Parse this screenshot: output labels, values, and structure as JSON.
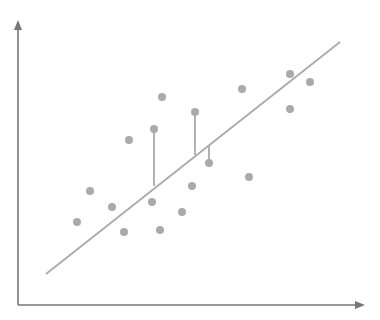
{
  "chart_data": {
    "type": "scatter",
    "title": "",
    "xlabel": "",
    "ylabel": "",
    "grid": false,
    "legend": null,
    "annotations": [
      "linear regression line",
      "residual lines for 3 points"
    ],
    "xlim": [
      0,
      100
    ],
    "ylim": [
      0,
      100
    ],
    "points": [
      {
        "x": 17,
        "y": 29
      },
      {
        "x": 21,
        "y": 40
      },
      {
        "x": 27,
        "y": 34
      },
      {
        "x": 30,
        "y": 26
      },
      {
        "x": 32,
        "y": 58
      },
      {
        "x": 39,
        "y": 36
      },
      {
        "x": 39,
        "y": 62
      },
      {
        "x": 41,
        "y": 26
      },
      {
        "x": 41,
        "y": 73
      },
      {
        "x": 47,
        "y": 33
      },
      {
        "x": 50,
        "y": 42
      },
      {
        "x": 51,
        "y": 68
      },
      {
        "x": 55,
        "y": 50
      },
      {
        "x": 65,
        "y": 76
      },
      {
        "x": 67,
        "y": 45
      },
      {
        "x": 78,
        "y": 81
      },
      {
        "x": 78,
        "y": 69
      },
      {
        "x": 84,
        "y": 78
      }
    ],
    "regression_line": {
      "x1": 8,
      "y1": 11,
      "x2": 93,
      "y2": 92
    },
    "residuals": [
      {
        "x": 39,
        "y_point": 62,
        "y_line": 42
      },
      {
        "x": 51,
        "y_point": 68,
        "y_line": 52
      },
      {
        "x": 55,
        "y_point": 50,
        "y_line": 56
      }
    ],
    "colors": {
      "points": "#aaaaaa",
      "line": "#aaaaaa",
      "residual": "#888888",
      "axis": "#777777"
    }
  },
  "px": {
    "origin": [
      18,
      305
    ],
    "x_end": 365,
    "y_end": 20,
    "points": [
      [
        77,
        222
      ],
      [
        90,
        191
      ],
      [
        112,
        207
      ],
      [
        124,
        232
      ],
      [
        129,
        140
      ],
      [
        152,
        202
      ],
      [
        154,
        129
      ],
      [
        160,
        230
      ],
      [
        162,
        97
      ],
      [
        182,
        212
      ],
      [
        192,
        186
      ],
      [
        195,
        112
      ],
      [
        209,
        163
      ],
      [
        242,
        89
      ],
      [
        249,
        177
      ],
      [
        290,
        74
      ],
      [
        290,
        109
      ],
      [
        310,
        82
      ]
    ],
    "line": [
      46,
      274,
      340,
      42
    ],
    "residuals": [
      [
        154,
        129,
        154,
        186
      ],
      [
        195,
        112,
        195,
        155
      ],
      [
        209,
        163,
        209,
        145
      ]
    ]
  }
}
